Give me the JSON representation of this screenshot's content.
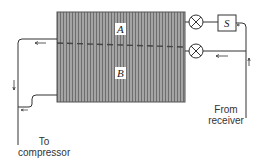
{
  "diagram": {
    "type": "refrigeration-evaporator-schematic",
    "evaporator": {
      "regions": [
        {
          "id": "A",
          "label": "A"
        },
        {
          "id": "B",
          "label": "B"
        }
      ],
      "divider": "dashed"
    },
    "valves": [
      {
        "id": "valve-upper",
        "symbol": "circle-x",
        "feeds": "A"
      },
      {
        "id": "valve-lower",
        "symbol": "circle-x",
        "feeds": "B"
      }
    ],
    "solenoid": {
      "label": "S"
    },
    "labels": {
      "inlet_line1": "From",
      "inlet_line2": "receiver",
      "outlet_line1": "To",
      "outlet_line2": "compressor"
    },
    "colors": {
      "line": "#333333",
      "hatch_bg": "#9a9a9a",
      "hatch_line": "#6a6a6a",
      "background": "#ffffff"
    }
  }
}
